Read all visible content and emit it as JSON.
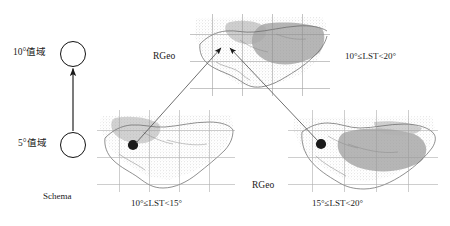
{
  "figure": {
    "type": "diagram",
    "background": "#ffffff",
    "ink_color": "#1a1a1a"
  },
  "schema": {
    "caption": "Schema",
    "nodes": [
      {
        "id": "top",
        "label": "10°值域",
        "shape": "circle"
      },
      {
        "id": "bottom",
        "label": "5°值域",
        "shape": "circle"
      }
    ],
    "edge": {
      "from": "bottom",
      "to": "top",
      "style": "arrow-up"
    }
  },
  "maps": [
    {
      "id": "merged",
      "position": "top-center",
      "side_label": "RGeo",
      "range_label": "10°≤LST<20°",
      "has_dot": false,
      "grid": true
    },
    {
      "id": "lower-left",
      "position": "bottom-left",
      "side_label": "",
      "range_label": "10°≤LST<15°",
      "has_dot": true,
      "grid": true
    },
    {
      "id": "lower-right",
      "position": "bottom-right",
      "side_label": "RGeo",
      "range_label": "15°≤LST<20°",
      "has_dot": true,
      "grid": true
    }
  ],
  "connectors": [
    {
      "from": "lower-left",
      "to": "merged",
      "style": "arrow"
    },
    {
      "from": "lower-right",
      "to": "merged",
      "style": "arrow"
    }
  ]
}
